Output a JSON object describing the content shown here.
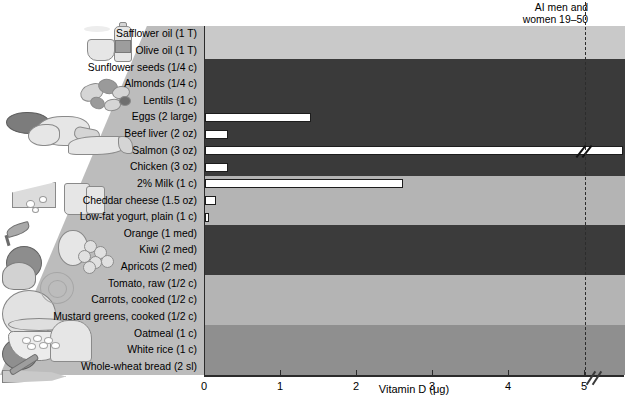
{
  "figure": {
    "annotation": {
      "line1": "AI men and",
      "line2": "women 19–50",
      "value": 5
    }
  },
  "axis": {
    "label": "Vitamin D (μg)",
    "ticks": [
      "0",
      "1",
      "2",
      "3",
      "4",
      "5"
    ],
    "tick_values": [
      0,
      1,
      2,
      3,
      4,
      5
    ],
    "min": 0,
    "max": 5,
    "has_break": true
  },
  "groups": [
    {
      "name": "oils",
      "color": "#c9c9c9",
      "illustration": "oil-bottle-and-cup-icon"
    },
    {
      "name": "protein",
      "color": "#3a3a3a",
      "illustration": "meat-fish-poultry-icon"
    },
    {
      "name": "dairy",
      "color": "#b4b4b4",
      "illustration": "cheese-milk-icon"
    },
    {
      "name": "fruits",
      "color": "#3b3b3b",
      "illustration": "apple-pear-grapes-icon"
    },
    {
      "name": "vegetables",
      "color": "#b4b4b4",
      "illustration": "cabbage-tomato-carrot-icon"
    },
    {
      "name": "grains",
      "color": "#8f8f8f",
      "illustration": "bread-and-oatmeal-bowl-icon"
    }
  ],
  "chart_data": {
    "type": "bar",
    "orientation": "horizontal",
    "title": "Vitamin D (μg)",
    "xlabel": "Vitamin D (μg)",
    "ylabel": "",
    "xlim": [
      0,
      5
    ],
    "grid": false,
    "legend": null,
    "reference_line": {
      "label": "AI men and women 19–50",
      "value": 5
    },
    "categories": [
      "Safflower oil (1 T)",
      "Olive oil (1 T)",
      "Sunflower seeds (1/4 c)",
      "Almonds (1/4 c)",
      "Lentils (1 c)",
      "Eggs (2 large)",
      "Beef liver (2 oz)",
      "Salmon (3 oz)",
      "Chicken (3 oz)",
      "2% Milk (1 c)",
      "Cheddar cheese (1.5 oz)",
      "Low-fat yogurt, plain (1 c)",
      "Orange (1 med)",
      "Kiwi (2 med)",
      "Apricots (2 med)",
      "Tomato, raw (1/2 c)",
      "Carrots, cooked (1/2 c)",
      "Mustard greens, cooked (1/2 c)",
      "Oatmeal (1 c)",
      "White rice (1 c)",
      "Whole-wheat bread (2 sl)"
    ],
    "values": [
      0,
      0,
      0,
      0,
      0,
      1.4,
      0.3,
      5.4,
      0.3,
      2.6,
      0.15,
      0.05,
      0,
      0,
      0,
      0,
      0,
      0,
      0,
      0,
      0
    ],
    "group_of": [
      "oils",
      "oils",
      "protein",
      "protein",
      "protein",
      "protein",
      "protein",
      "protein",
      "protein",
      "dairy",
      "dairy",
      "dairy",
      "fruits",
      "fruits",
      "fruits",
      "vegetables",
      "vegetables",
      "vegetables",
      "grains",
      "grains",
      "grains"
    ],
    "exceeds_axis": [
      false,
      false,
      false,
      false,
      false,
      false,
      false,
      true,
      false,
      false,
      false,
      false,
      false,
      false,
      false,
      false,
      false,
      false,
      false,
      false,
      false
    ]
  }
}
